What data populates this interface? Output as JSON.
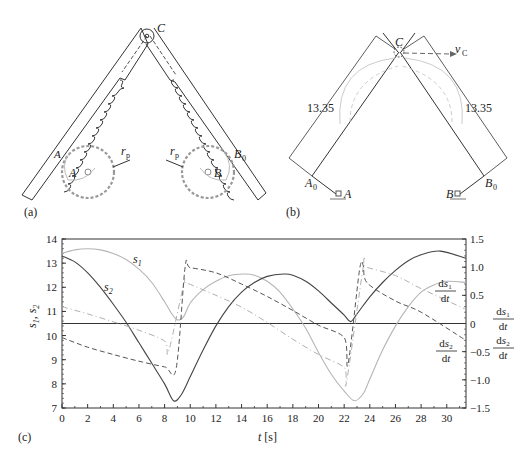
{
  "figure": {
    "panel_a": {
      "label": "(a)",
      "points": {
        "C": "C",
        "A": "A",
        "A0": "A",
        "B": "B",
        "B0": "B",
        "rp_left": "r",
        "rp_right": "r"
      },
      "subscripts": {
        "A0": "0",
        "B0": "0",
        "rp": "p"
      }
    },
    "panel_b": {
      "label": "(b)",
      "dimension_left": "13.35",
      "dimension_right": "13.35",
      "points": {
        "C": "C",
        "A": "A",
        "A0": "A",
        "B": "B",
        "B0": "B",
        "vC": "v"
      },
      "subscripts": {
        "A0": "0",
        "B0": "0",
        "vC": "C"
      }
    },
    "panel_c": {
      "label": "(c)"
    }
  },
  "chart_data": {
    "type": "line",
    "title": "",
    "xlabel": "t [s]",
    "ylabel_left": "s1, s2",
    "ylabel_right": "ds1/dt, ds2/dt",
    "xlim": [
      0,
      31.5
    ],
    "ylim_left": [
      7,
      14
    ],
    "ylim_right": [
      -1.5,
      1.5
    ],
    "x_ticks": [
      0,
      2,
      4,
      6,
      8,
      10,
      12,
      14,
      16,
      18,
      20,
      22,
      24,
      26,
      28,
      30
    ],
    "y_ticks_left": [
      7,
      8,
      9,
      10,
      11,
      12,
      13,
      14
    ],
    "y_ticks_right": [
      "-1.5",
      "-1.0",
      "-0.5",
      "0",
      "0.5",
      "1.0",
      "1.5"
    ],
    "grid": false,
    "reference_line": {
      "axis": "right",
      "value": 0
    },
    "annotations": [
      "s1",
      "s2",
      "ds1/dt",
      "ds2/dt"
    ],
    "series": [
      {
        "name": "s1",
        "axis": "left",
        "style": "solid-light",
        "t": [
          0,
          1,
          2,
          3,
          4,
          5,
          6,
          7,
          8,
          8.5,
          9,
          9.5,
          10,
          11,
          12,
          13,
          14.2,
          15,
          16,
          17,
          18,
          19,
          20,
          21,
          22,
          22.8,
          23.5,
          24,
          25,
          26,
          27,
          28,
          29,
          30,
          31.5
        ],
        "values": [
          13.4,
          13.55,
          13.6,
          13.55,
          13.4,
          13.15,
          12.75,
          12.2,
          11.4,
          10.95,
          10.65,
          10.8,
          11.35,
          11.9,
          12.25,
          12.48,
          12.55,
          12.5,
          12.25,
          11.8,
          11.1,
          10.3,
          9.3,
          8.4,
          7.7,
          7.3,
          7.6,
          8.2,
          9.4,
          10.4,
          11.2,
          11.8,
          12.1,
          12.25,
          12.2
        ]
      },
      {
        "name": "s2",
        "axis": "left",
        "style": "solid-dark",
        "t": [
          0,
          1,
          2,
          3,
          4,
          5,
          6,
          7,
          8,
          8.7,
          9.3,
          10,
          11,
          12,
          13,
          14,
          15,
          16,
          17.3,
          18,
          19,
          20,
          21,
          22,
          22.5,
          23,
          24,
          25,
          26,
          27,
          28,
          29.5,
          31.5
        ],
        "values": [
          13.3,
          13.05,
          12.6,
          12.0,
          11.3,
          10.55,
          9.7,
          8.85,
          8.0,
          7.3,
          7.55,
          8.3,
          9.4,
          10.4,
          11.2,
          11.8,
          12.2,
          12.45,
          12.55,
          12.5,
          12.25,
          11.85,
          11.35,
          10.85,
          10.58,
          10.9,
          11.6,
          12.2,
          12.7,
          13.1,
          13.35,
          13.5,
          13.2
        ]
      },
      {
        "name": "ds1/dt",
        "axis": "right",
        "style": "dashed-light",
        "t": [
          0,
          2,
          4,
          6,
          8,
          8.3,
          9.5,
          9.7,
          12,
          14,
          16,
          18,
          20,
          22,
          22.2,
          23.5,
          23.7,
          26,
          28,
          31.5
        ],
        "values": [
          0.3,
          0.17,
          0.03,
          -0.12,
          -0.31,
          -0.5,
          0.7,
          0.72,
          0.5,
          0.29,
          0.02,
          -0.28,
          -0.55,
          -0.78,
          -1.02,
          1.02,
          1.0,
          0.85,
          0.62,
          0.25
        ]
      },
      {
        "name": "ds2/dt",
        "axis": "right",
        "style": "dashed-dark",
        "t": [
          0,
          2,
          4,
          6,
          8,
          8.9,
          9.6,
          10,
          12,
          14,
          16,
          18,
          20,
          22,
          22.3,
          23.2,
          23.5,
          23.8,
          26,
          28,
          31.5
        ],
        "values": [
          -0.25,
          -0.42,
          -0.55,
          -0.67,
          -0.77,
          -0.8,
          1.0,
          0.99,
          0.9,
          0.7,
          0.48,
          0.23,
          -0.03,
          -0.25,
          -0.72,
          0.95,
          1.02,
          0.72,
          0.4,
          0.2,
          -0.3
        ]
      }
    ]
  }
}
